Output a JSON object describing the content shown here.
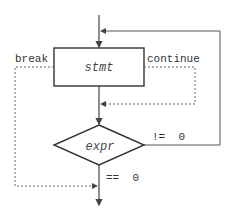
{
  "diagram": {
    "type": "flowchart",
    "nodes": {
      "statement": "stmt",
      "condition": "expr"
    },
    "labels": {
      "break": "break",
      "continue": "continue",
      "not_zero": "!=  0",
      "equals_zero": "==  0"
    },
    "colors": {
      "line": "#444444",
      "dotted": "#666666",
      "background": "#ffffff"
    }
  }
}
